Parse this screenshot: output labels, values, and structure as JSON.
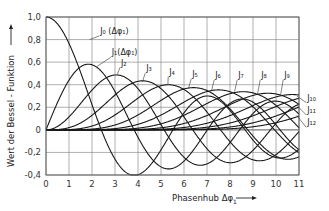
{
  "chart_data": {
    "type": "line",
    "title": "",
    "xlabel": "Phasenhub Δφ₁",
    "ylabel": "Wert der Bessel-Funktion",
    "xlim": [
      0,
      11
    ],
    "ylim": [
      -0.4,
      1.0
    ],
    "x_ticks": [
      "0",
      "1",
      "2",
      "3",
      "4",
      "5",
      "6",
      "7",
      "8",
      "9",
      "10",
      "11"
    ],
    "y_ticks": [
      "1,0",
      "0,8",
      "0,6",
      "0,4",
      "0,2",
      "0",
      "-0,2",
      "-0,4"
    ],
    "y_tick_values": [
      1.0,
      0.8,
      0.6,
      0.4,
      0.2,
      0,
      -0.2,
      -0.4
    ],
    "grid": true,
    "legend_position": "inline labels on curves",
    "series": [
      {
        "name": "J0(Δφ1)",
        "order": 0,
        "label": "J₀ (Δφ₁)",
        "label_pos": [
          2.4,
          0.85
        ],
        "anchor": [
          1.9,
          0.8
        ]
      },
      {
        "name": "J1(Δφ1)",
        "order": 1,
        "label": "J₁(Δφ₁)",
        "label_pos": [
          2.9,
          0.66
        ],
        "anchor": [
          2.2,
          0.56
        ]
      },
      {
        "name": "J2",
        "order": 2,
        "label": "J₂",
        "label_pos": [
          3.3,
          0.57
        ],
        "anchor": [
          3.1,
          0.49
        ]
      },
      {
        "name": "J3",
        "order": 3,
        "label": "J₃",
        "label_pos": [
          4.4,
          0.52
        ],
        "anchor": [
          4.2,
          0.43
        ]
      },
      {
        "name": "J4",
        "order": 4,
        "label": "J₄",
        "label_pos": [
          5.4,
          0.49
        ],
        "anchor": [
          5.3,
          0.4
        ]
      },
      {
        "name": "J5",
        "order": 5,
        "label": "J₅",
        "label_pos": [
          6.4,
          0.47
        ],
        "anchor": [
          6.2,
          0.37
        ]
      },
      {
        "name": "J6",
        "order": 6,
        "label": "J₆",
        "label_pos": [
          7.4,
          0.46
        ],
        "anchor": [
          7.2,
          0.35
        ]
      },
      {
        "name": "J7",
        "order": 7,
        "label": "J₇",
        "label_pos": [
          8.4,
          0.46
        ],
        "anchor": [
          8.2,
          0.34
        ]
      },
      {
        "name": "J8",
        "order": 8,
        "label": "J₈",
        "label_pos": [
          9.4,
          0.46
        ],
        "anchor": [
          9.2,
          0.32
        ]
      },
      {
        "name": "J9",
        "order": 9,
        "label": "J₉",
        "label_pos": [
          10.4,
          0.46
        ],
        "anchor": [
          10.2,
          0.31
        ]
      },
      {
        "name": "J10",
        "order": 10,
        "label": "J₁₀",
        "label_pos": [
          11.4,
          0.26
        ],
        "anchor": [
          10.9,
          0.3
        ]
      },
      {
        "name": "J11",
        "order": 11,
        "label": "J₁₁",
        "label_pos": [
          11.4,
          0.15
        ],
        "anchor": [
          10.9,
          0.22
        ]
      },
      {
        "name": "J12",
        "order": 12,
        "label": "J₁₂",
        "label_pos": [
          11.4,
          0.04
        ],
        "anchor": [
          10.9,
          0.13
        ]
      }
    ],
    "series_note": "Curves are Bessel functions of the first kind J_n(x) for n = 0..12, sampled over x in [0, 11]",
    "key_values": {
      "J0_at_0": 1.0,
      "J0_min": -0.4,
      "J1_max": 0.58,
      "J1_max_x": 1.84,
      "J2_max": 0.49,
      "J2_max_x": 3.05,
      "J3_max": 0.43,
      "J3_max_x": 4.2
    }
  },
  "axes": {
    "x_title": "Phasenhub Δφ",
    "x_title_sub": "1",
    "x_arrow": "→",
    "y_title": "Wert der Bessel - Funktion",
    "y_arrow": "→"
  },
  "colors": {
    "curve": "#1a1a1a",
    "grid": "#7a7a7a",
    "background": "#ffffff"
  }
}
